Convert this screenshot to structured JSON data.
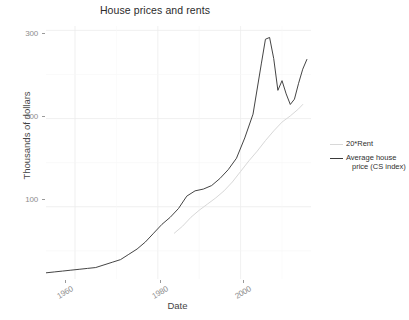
{
  "chart_data": {
    "type": "line",
    "title": "House prices and rents",
    "xlabel": "Date",
    "ylabel": "Thousands of dollars",
    "xlim": [
      1953,
      2017
    ],
    "ylim": [
      18,
      305
    ],
    "xticks": [
      1960,
      1980,
      2000
    ],
    "xtick_labels": [
      "1960",
      "1980",
      "2000"
    ],
    "yticks": [
      100,
      200,
      300
    ],
    "ytick_labels": [
      "100",
      "200",
      "300"
    ],
    "grid": true,
    "legend_position": "right",
    "series": [
      {
        "name": "20*Rent",
        "color": "#d8d8d8",
        "x": [
          1984,
          1986,
          1988,
          1990,
          1992,
          1994,
          1996,
          1998,
          2000,
          2002,
          2004,
          2006,
          2008,
          2010,
          2012,
          2014,
          2015
        ],
        "values": [
          70,
          78,
          88,
          96,
          103,
          110,
          118,
          128,
          140,
          152,
          163,
          175,
          186,
          196,
          203,
          211,
          216
        ]
      },
      {
        "name": "Average house price (CS index)",
        "color": "#3a3a3a",
        "x": [
          1953,
          1955,
          1957,
          1959,
          1961,
          1963,
          1965,
          1967,
          1969,
          1971,
          1973,
          1975,
          1977,
          1979,
          1981,
          1983,
          1985,
          1987,
          1989,
          1991,
          1993,
          1995,
          1997,
          1999,
          2001,
          2003,
          2005,
          2006,
          2007,
          2008,
          2009,
          2010,
          2011,
          2012,
          2013,
          2014,
          2015,
          2016
        ],
        "values": [
          25,
          26,
          27,
          28,
          29,
          30,
          31,
          34,
          37,
          40,
          46,
          52,
          60,
          70,
          80,
          88,
          98,
          112,
          118,
          120,
          124,
          132,
          142,
          155,
          178,
          205,
          262,
          290,
          292,
          268,
          232,
          243,
          228,
          216,
          222,
          240,
          256,
          267
        ]
      }
    ]
  },
  "legend": {
    "items": [
      {
        "label": "20*Rent",
        "color": "#d8d8d8"
      },
      {
        "label": "Average house price (CS index)",
        "color": "#3a3a3a"
      }
    ]
  }
}
